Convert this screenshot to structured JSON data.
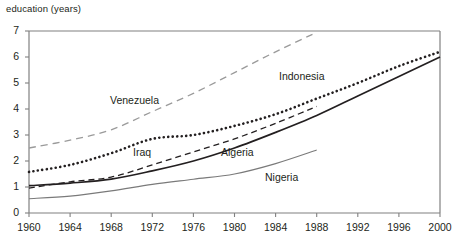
{
  "chart_data": {
    "type": "line",
    "title": "",
    "subtitle": "",
    "ylabel": "education (years)",
    "xlabel": "",
    "xlim": [
      1960,
      2000
    ],
    "ylim": [
      0,
      7
    ],
    "grid": false,
    "legend_position": "inline-annotations",
    "xticks": [
      1960,
      1964,
      1968,
      1972,
      1976,
      1980,
      1984,
      1988,
      1992,
      1996,
      2000
    ],
    "yticks": [
      0,
      1,
      2,
      3,
      4,
      5,
      6,
      7
    ],
    "x": [
      1960,
      1964,
      1968,
      1972,
      1976,
      1980,
      1984,
      1988,
      1992,
      1996,
      2000
    ],
    "series": [
      {
        "name": "Venezuela",
        "style": "long-dashed",
        "color": "#9a9a9a",
        "x": [
          1960,
          1964,
          1968,
          1972,
          1976,
          1980,
          1984,
          1988
        ],
        "values": [
          2.5,
          2.8,
          3.2,
          3.9,
          4.6,
          5.4,
          6.2,
          6.95
        ]
      },
      {
        "name": "Indonesia",
        "style": "dotted",
        "color": "#231f20",
        "x": [
          1960,
          1964,
          1968,
          1972,
          1976,
          1980,
          1984,
          1988,
          1992,
          1996,
          2000
        ],
        "values": [
          1.58,
          1.85,
          2.3,
          2.85,
          3.0,
          3.35,
          3.8,
          4.4,
          5.0,
          5.65,
          6.2
        ]
      },
      {
        "name": "Algeria",
        "style": "solid",
        "color": "#231f20",
        "x": [
          1960,
          1964,
          1968,
          1972,
          1976,
          1980,
          1984,
          1988,
          1992,
          1996,
          2000
        ],
        "values": [
          1.05,
          1.15,
          1.3,
          1.62,
          2.0,
          2.5,
          3.1,
          3.75,
          4.5,
          5.25,
          6.0
        ]
      },
      {
        "name": "Iraq",
        "style": "dashed",
        "color": "#231f20",
        "x": [
          1960,
          1964,
          1968,
          1972,
          1976,
          1980,
          1984,
          1988
        ],
        "values": [
          0.96,
          1.2,
          1.38,
          1.85,
          2.35,
          2.85,
          3.45,
          4.1
        ]
      },
      {
        "name": "Nigeria",
        "style": "solid-thin",
        "color": "#7a7a7a",
        "x": [
          1960,
          1964,
          1968,
          1972,
          1976,
          1980,
          1984,
          1988
        ],
        "values": [
          0.55,
          0.65,
          0.85,
          1.1,
          1.3,
          1.5,
          1.9,
          2.42
        ]
      }
    ],
    "annotations": [
      {
        "text": "Venezuela",
        "x_px": 110,
        "y_px": 95
      },
      {
        "text": "Indonesia",
        "x_px": 279,
        "y_px": 71
      },
      {
        "text": "Iraq",
        "x_px": 133,
        "y_px": 147
      },
      {
        "text": "Algeria",
        "x_px": 221,
        "y_px": 147
      },
      {
        "text": "Nigeria",
        "x_px": 265,
        "y_px": 172
      }
    ]
  },
  "axes": {
    "y_label_text": "education (years)",
    "y_tick_labels": [
      "7",
      "6",
      "5",
      "4",
      "3",
      "2",
      "1",
      "0"
    ],
    "x_tick_labels": [
      "1960",
      "1964",
      "1968",
      "1972",
      "1976",
      "1980",
      "1984",
      "1988",
      "1992",
      "1996",
      "2000"
    ]
  },
  "colors": {
    "axis": "#808080",
    "text": "#231f20",
    "dark_series": "#231f20",
    "light_series": "#9a9a9a",
    "nigeria": "#7a7a7a"
  }
}
